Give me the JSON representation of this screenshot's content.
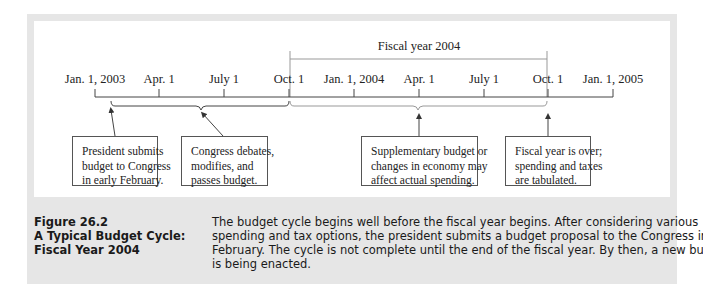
{
  "figure": {
    "number": "Figure 26.2",
    "title_lines": [
      "A Typical Budget Cycle:",
      "Fiscal Year 2004"
    ],
    "description_lines": [
      "The budget cycle begins well before the fiscal year begins. After considering various",
      "spending and tax options, the president submits a budget proposal to the Congress in",
      "February. The cycle is not complete until the end of the fiscal year. By then, a new budget",
      "is being enacted."
    ]
  },
  "timeline": {
    "fiscal_year_label": "Fiscal year 2004",
    "ticks": [
      {
        "label": "Jan. 1, 2003"
      },
      {
        "label": "Apr. 1"
      },
      {
        "label": "July 1"
      },
      {
        "label": "Oct. 1"
      },
      {
        "label": "Jan. 1, 2004"
      },
      {
        "label": "Apr. 1"
      },
      {
        "label": "July 1"
      },
      {
        "label": "Oct. 1"
      },
      {
        "label": "Jan. 1, 2005"
      }
    ],
    "fiscal_year_span": {
      "start_tick": 3,
      "end_tick": 7
    }
  },
  "notes": [
    {
      "lines": [
        "President submits",
        "budget to Congress",
        "in early February."
      ]
    },
    {
      "lines": [
        "Congress debates,",
        "modifies, and",
        "passes budget."
      ]
    },
    {
      "lines": [
        "Supplementary budget or",
        "changes in economy may",
        "affect actual spending."
      ]
    },
    {
      "lines": [
        "Fiscal year is over;",
        "spending and taxes",
        "are tabulated."
      ]
    }
  ],
  "colors": {
    "frame": "#e6e6e6",
    "line": "#444444",
    "fiscal_line": "#888888"
  }
}
